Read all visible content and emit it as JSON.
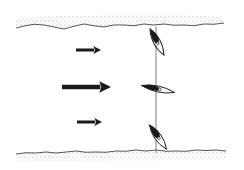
{
  "diagram": {
    "type": "flow-profile-illustration",
    "colors": {
      "ink": "#1a1a1a",
      "stipple": "#8c8c8c",
      "line": "#6e6e6e",
      "background": "#ffffff"
    },
    "boundaries": [
      {
        "id": "top-wall",
        "y": 27,
        "x_start": 16,
        "x_end": 224,
        "shading": "above"
      },
      {
        "id": "bottom-wall",
        "y": 153,
        "x_start": 16,
        "x_end": 226,
        "shading": "below"
      }
    ],
    "arrows": [
      {
        "id": "arrow-top",
        "x1": 76,
        "x2": 101,
        "y": 50,
        "thickness": 3,
        "size": "small"
      },
      {
        "id": "arrow-middle",
        "x1": 62,
        "x2": 111,
        "y": 87,
        "thickness": 4.5,
        "size": "large"
      },
      {
        "id": "arrow-bottom",
        "x1": 77,
        "x2": 102,
        "y": 122,
        "thickness": 3,
        "size": "small"
      }
    ],
    "vertical_line": {
      "x": 156,
      "y1": 27,
      "y2": 153
    },
    "elements": [
      {
        "id": "element-top",
        "cx": 157,
        "cy": 42,
        "length": 30,
        "width": 7,
        "angle": 62
      },
      {
        "id": "element-middle",
        "cx": 158,
        "cy": 89,
        "length": 34,
        "width": 6,
        "angle": 12
      },
      {
        "id": "element-bottom",
        "cx": 158,
        "cy": 137,
        "length": 30,
        "width": 7,
        "angle": 55
      }
    ]
  }
}
